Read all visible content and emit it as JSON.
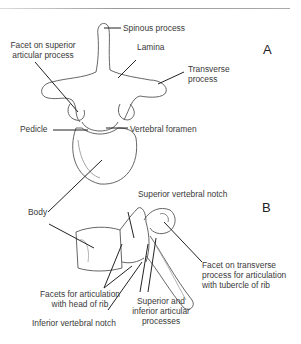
{
  "figure": {
    "panels": [
      {
        "id": "A",
        "view": "superior view",
        "labels": {
          "spinous_process": "Spinous process",
          "facet_superior_1": "Facet on superior",
          "facet_superior_2": "articular process",
          "lamina": "Lamina",
          "transverse_1": "Transverse",
          "transverse_2": "process",
          "pedicle": "Pedicle",
          "vertebral_foramen": "Vertebral foramen",
          "body": "Body"
        }
      },
      {
        "id": "B",
        "view": "lateral view",
        "labels": {
          "superior_notch": "Superior vertebral notch",
          "facets_rib_1": "Facets for articulation",
          "facets_rib_2": "with head of rib",
          "inferior_notch": "Inferior vertebral notch",
          "articular_1": "Superior and",
          "articular_2": "inferior articular",
          "articular_3": "processes",
          "facet_transverse_1": "Facet on transverse",
          "facet_transverse_2": "process for articulation",
          "facet_transverse_3": "with tubercle of rib"
        }
      }
    ]
  }
}
